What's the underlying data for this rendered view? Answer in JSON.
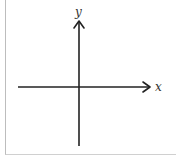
{
  "diagram": {
    "type": "cartesian-axes",
    "x_axis": {
      "label": "x",
      "direction": "right",
      "arrow": true
    },
    "y_axis": {
      "label": "y",
      "direction": "up",
      "arrow": true
    },
    "origin": {
      "x": 79,
      "y": 87
    },
    "colors": {
      "axis": "#222222",
      "label": "#333333",
      "frame": "#bdbdbd"
    }
  }
}
